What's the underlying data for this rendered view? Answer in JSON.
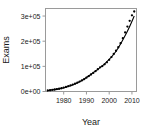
{
  "chart_data": {
    "type": "scatter",
    "title": "",
    "xlabel": "Year",
    "ylabel": "Exams",
    "xlim": [
      1972,
      2012
    ],
    "ylim": [
      0,
      330000
    ],
    "grid": false,
    "legend": null,
    "xticks": [
      1980,
      1990,
      2000,
      2010
    ],
    "xticklabels": [
      "1980",
      "1990",
      "2000",
      "2010"
    ],
    "yticks": [
      0,
      100000,
      200000,
      300000
    ],
    "yticklabels": [
      "0e+00",
      "1e+05",
      "2e+05",
      "3e+05"
    ],
    "series": [
      {
        "name": "Exams",
        "type": "scatter",
        "marker": "filled-circle",
        "color": "#000000",
        "x": [
          1973,
          1974,
          1975,
          1976,
          1977,
          1978,
          1979,
          1980,
          1981,
          1982,
          1983,
          1984,
          1985,
          1986,
          1987,
          1988,
          1989,
          1990,
          1991,
          1992,
          1993,
          1994,
          1995,
          1996,
          1997,
          1998,
          1999,
          2000,
          2001,
          2002,
          2003,
          2004,
          2005,
          2006,
          2007,
          2008,
          2009,
          2010,
          2011
        ],
        "values": [
          4000,
          5000,
          6500,
          8000,
          9500,
          11000,
          13000,
          15500,
          18000,
          21000,
          24000,
          27500,
          31000,
          35000,
          39500,
          44000,
          49000,
          55000,
          61000,
          67500,
          74000,
          81000,
          88500,
          96000,
          101000,
          108000,
          116000,
          126000,
          137000,
          149000,
          162000,
          176000,
          192000,
          212000,
          235000,
          258000,
          281000,
          303000,
          318000
        ]
      },
      {
        "name": "Fitted exponential curve",
        "type": "line",
        "color": "#000000",
        "x": [
          1973,
          1978,
          1983,
          1988,
          1993,
          1998,
          2003,
          2008,
          2011
        ],
        "values": [
          4200,
          10500,
          23000,
          44000,
          75000,
          110000,
          160000,
          240000,
          300000
        ]
      }
    ]
  },
  "axes": {
    "y_axis_title": "Exams",
    "x_axis_title": "Year"
  }
}
